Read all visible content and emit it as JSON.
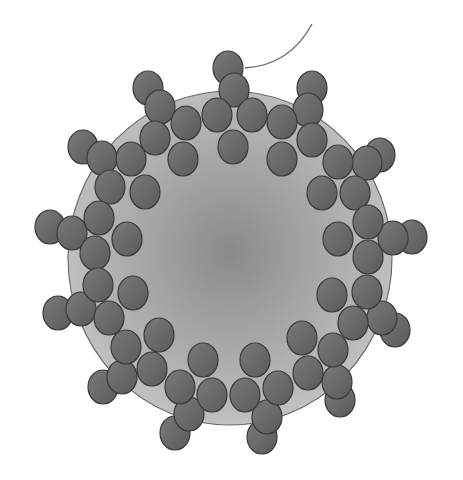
{
  "figure": {
    "width": 463,
    "height": 480,
    "background": "#ffffff",
    "colors": {
      "body_center": "#8a8a8a",
      "body_edge": "#c4c4c4",
      "body_outline": "#6b6b6b",
      "knob_fill_light": "#7a7a7a",
      "knob_fill_dark": "#5a5a5a",
      "knob_outline": "#3a3a3a",
      "tail_stroke": "#6a6a6a"
    },
    "body": {
      "cx": 230,
      "cy": 258,
      "rx": 162,
      "ry": 167
    },
    "tail": {
      "path": "M 245 68 Q 290 65 312 24"
    },
    "knob_size": {
      "rx": 15,
      "ry": 17
    },
    "clusters": [
      {
        "name": "top",
        "knobs": [
          [
            228,
            68
          ],
          [
            234,
            90
          ],
          [
            217,
            115
          ],
          [
            252,
            115
          ],
          [
            233,
            147
          ]
        ]
      },
      {
        "name": "top-left",
        "knobs": [
          [
            148,
            88
          ],
          [
            160,
            107
          ],
          [
            186,
            123
          ],
          [
            155,
            138
          ],
          [
            183,
            159
          ]
        ]
      },
      {
        "name": "top-right",
        "knobs": [
          [
            312,
            88
          ],
          [
            308,
            110
          ],
          [
            282,
            122
          ],
          [
            312,
            140
          ],
          [
            282,
            159
          ]
        ]
      },
      {
        "name": "left-upper",
        "knobs": [
          [
            83,
            147
          ],
          [
            102,
            158
          ],
          [
            131,
            159
          ],
          [
            110,
            187
          ],
          [
            145,
            192
          ]
        ]
      },
      {
        "name": "right-upper",
        "knobs": [
          [
            380,
            155
          ],
          [
            367,
            163
          ],
          [
            338,
            162
          ],
          [
            322,
            193
          ],
          [
            355,
            193
          ]
        ]
      },
      {
        "name": "left-middle",
        "knobs": [
          [
            50,
            227
          ],
          [
            72,
            233
          ],
          [
            99,
            218
          ],
          [
            127,
            239
          ],
          [
            95,
            253
          ]
        ]
      },
      {
        "name": "right-middle",
        "knobs": [
          [
            412,
            237
          ],
          [
            393,
            238
          ],
          [
            368,
            222
          ],
          [
            338,
            239
          ],
          [
            368,
            257
          ]
        ]
      },
      {
        "name": "left-lower",
        "knobs": [
          [
            58,
            313
          ],
          [
            81,
            309
          ],
          [
            98,
            285
          ],
          [
            133,
            293
          ],
          [
            109,
            318
          ]
        ]
      },
      {
        "name": "right-lower",
        "knobs": [
          [
            395,
            330
          ],
          [
            382,
            318
          ],
          [
            367,
            292
          ],
          [
            332,
            295
          ],
          [
            353,
            323
          ]
        ]
      },
      {
        "name": "bottom-left",
        "knobs": [
          [
            103,
            387
          ],
          [
            122,
            377
          ],
          [
            126,
            347
          ],
          [
            159,
            335
          ],
          [
            152,
            369
          ]
        ]
      },
      {
        "name": "bottom-right",
        "knobs": [
          [
            340,
            400
          ],
          [
            337,
            382
          ],
          [
            333,
            350
          ],
          [
            302,
            338
          ],
          [
            308,
            373
          ]
        ]
      },
      {
        "name": "bottom-center-left",
        "knobs": [
          [
            175,
            433
          ],
          [
            189,
            414
          ],
          [
            180,
            387
          ],
          [
            212,
            395
          ],
          [
            203,
            360
          ]
        ]
      },
      {
        "name": "bottom-center-right",
        "knobs": [
          [
            262,
            437
          ],
          [
            267,
            417
          ],
          [
            278,
            388
          ],
          [
            245,
            395
          ],
          [
            255,
            360
          ]
        ]
      }
    ]
  }
}
